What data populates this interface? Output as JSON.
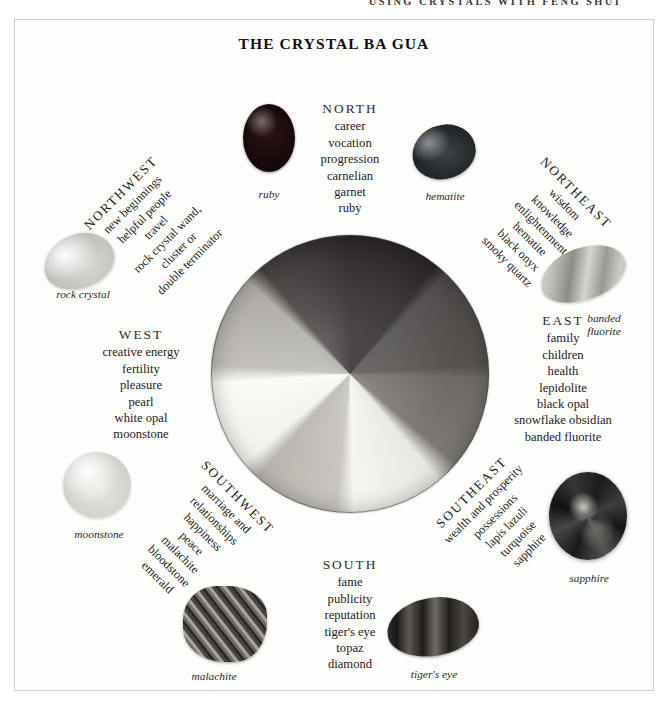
{
  "running_head": "USING CRYSTALS WITH FENG SHUI",
  "plate": {
    "title": "THE CRYSTAL BA GUA"
  },
  "sectors": {
    "north": {
      "direction": "NORTH",
      "keywords": [
        "career",
        "vocation",
        "progression",
        "carnelian",
        "garnet",
        "ruby"
      ]
    },
    "northeast": {
      "direction": "NORTHEAST",
      "keywords": [
        "wisdom",
        "knowledge",
        "enlightenment",
        "hematite",
        "black onyx",
        "smoky quartz"
      ]
    },
    "east": {
      "direction": "EAST",
      "keywords": [
        "family",
        "children",
        "health",
        "lepidolite",
        "black opal",
        "snowflake obsidian",
        "banded fluorite"
      ]
    },
    "southeast": {
      "direction": "SOUTHEAST",
      "keywords": [
        "wealth and prosperity",
        "possessions",
        "lapis lazuli",
        "turquoise",
        "sapphire"
      ]
    },
    "south": {
      "direction": "SOUTH",
      "keywords": [
        "fame",
        "publicity",
        "reputation",
        "tiger's eye",
        "topaz",
        "diamond"
      ]
    },
    "southwest": {
      "direction": "SOUTHWEST",
      "keywords": [
        "marriage and",
        "relationships",
        "happiness",
        "peace",
        "malachite",
        "bloodstone",
        "emerald"
      ]
    },
    "west": {
      "direction": "WEST",
      "keywords": [
        "creative energy",
        "fertility",
        "pleasure",
        "pearl",
        "white opal",
        "moonstone"
      ]
    },
    "northwest": {
      "direction": "NORTHWEST",
      "keywords": [
        "new beginnings",
        "helpful people",
        "travel",
        "rock crystal wand,",
        "cluster or",
        "double terminator"
      ]
    }
  },
  "stones": {
    "ruby": "ruby",
    "hematite": "hematite",
    "rock_crystal": "rock crystal",
    "banded_fluorite": "banded\nfluorite",
    "moonstone": "moonstone",
    "sapphire": "sapphire",
    "malachite": "malachite",
    "tigers_eye": "tiger's eye"
  },
  "colors": {
    "page_background": "#ffffff",
    "plate_background": "#fdfdfb",
    "plate_border": "#cfcfcf",
    "text": "#232323",
    "title": "#111111"
  }
}
